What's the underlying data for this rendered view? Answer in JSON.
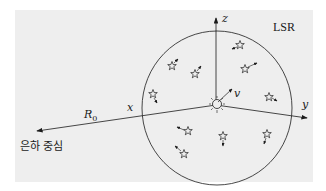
{
  "diagram": {
    "region_label": "LSR",
    "axes": {
      "x": "x",
      "y": "y",
      "z": "z"
    },
    "velocity_label": "v",
    "distance_label": "R",
    "distance_subscript": "0",
    "galactic_center_label": "은하 중심",
    "colors": {
      "background": "#eeeeee",
      "ink": "#1a1a1a"
    }
  }
}
